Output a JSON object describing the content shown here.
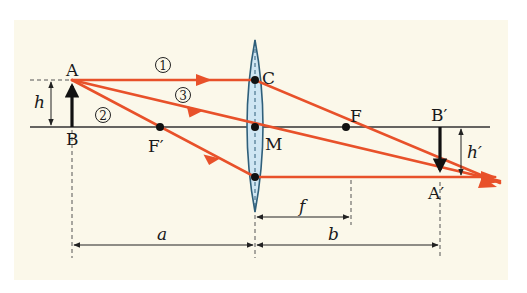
{
  "figure": {
    "colors": {
      "background": "#fbf8ea",
      "ray": "#e8512a",
      "lens_fill": "#cfe6f3",
      "lens_stroke": "#2f5f7a",
      "axis": "#333333",
      "arrow": "#111111"
    }
  },
  "points": {
    "A": "A",
    "B": "B",
    "C": "C",
    "F": "F",
    "F_prime": "F′",
    "M": "M",
    "A_prime": "A′",
    "B_prime": "B′"
  },
  "rays": {
    "ray1": "①",
    "ray2": "②",
    "ray3": "③"
  },
  "dimensions": {
    "h": "h",
    "h_prime": "h′",
    "a": "a",
    "b": "b",
    "f": "f"
  }
}
